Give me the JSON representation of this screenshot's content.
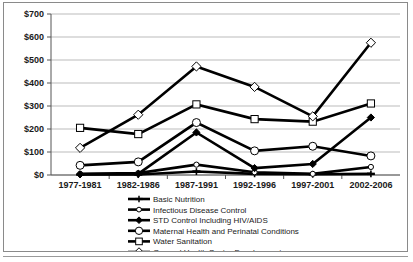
{
  "chart_data": {
    "type": "line",
    "title": "",
    "xlabel": "",
    "ylabel": "",
    "categories": [
      "1977-1981",
      "1982-1986",
      "1987-1991",
      "1992-1996",
      "1997-2001",
      "2002-2006"
    ],
    "ylim": [
      0,
      700
    ],
    "yticks": [
      0,
      100,
      200,
      300,
      400,
      500,
      600,
      700
    ],
    "ytick_labels": [
      "$0",
      "$100",
      "$200",
      "$300",
      "$400",
      "$500",
      "$600",
      "$700"
    ],
    "grid": true,
    "legend_position": "bottom",
    "series": [
      {
        "name": "Basic Nutrition",
        "marker": "dash",
        "values": [
          2,
          2,
          15,
          5,
          3,
          5
        ]
      },
      {
        "name": "Infectious Disease Control",
        "marker": "small-circle",
        "values": [
          5,
          8,
          45,
          12,
          5,
          35
        ]
      },
      {
        "name": "STD Control Including HIV/AIDS",
        "marker": "filled-diamond",
        "values": [
          3,
          5,
          185,
          30,
          48,
          250
        ]
      },
      {
        "name": "Maternal Health and Perinatal Conditions",
        "marker": "open-circle",
        "values": [
          42,
          57,
          228,
          105,
          125,
          83
        ]
      },
      {
        "name": "Water Sanitation",
        "marker": "open-square",
        "values": [
          205,
          178,
          307,
          243,
          232,
          311
        ]
      },
      {
        "name": "General Health Sector Development",
        "marker": "open-diamond",
        "values": [
          118,
          262,
          472,
          383,
          255,
          575
        ]
      }
    ]
  }
}
